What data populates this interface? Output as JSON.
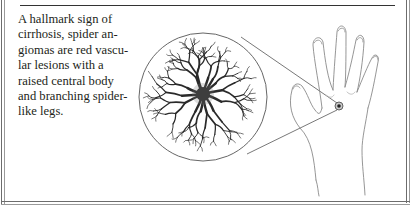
{
  "caption": {
    "lines": [
      "A hallmark sign of",
      "cirrhosis, spider an-",
      "giomas are red vascu-",
      "lar lesions with a",
      "raised central body",
      "and branching spider-",
      "like legs."
    ]
  },
  "illustration": {
    "subject": "spider angioma on back of hand",
    "magnified_view": "spider-angioma-closeup",
    "colors": {
      "ink": "#2a2a2a",
      "lesion_center": "#222222",
      "skin_outline": "#8a8a8a",
      "frame": "#6d6d6d"
    }
  }
}
